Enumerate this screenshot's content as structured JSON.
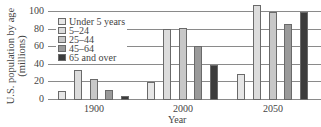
{
  "chart_data": {
    "type": "bar",
    "title": "",
    "xlabel": "Year",
    "ylabel": "U.S. population by age (millions)",
    "ylabel_lines": [
      "U.S. population by age",
      "(millions)"
    ],
    "ylim": [
      0,
      100
    ],
    "yticks": [
      "0",
      "20",
      "40",
      "60",
      "80",
      "100"
    ],
    "grid": true,
    "legend_position": "upper-left",
    "categories": [
      "1900",
      "2000",
      "2050"
    ],
    "series": [
      {
        "name": "Under 5 years",
        "color": "#e6e6e6",
        "values": [
          9,
          19,
          28
        ]
      },
      {
        "name": "5–24",
        "color": "#dcdcdc",
        "values": [
          33,
          79,
          107
        ]
      },
      {
        "name": "25–44",
        "color": "#c8c8c8",
        "values": [
          23,
          81,
          99
        ]
      },
      {
        "name": "45–64",
        "color": "#9a9a9a",
        "values": [
          10,
          60,
          85
        ]
      },
      {
        "name": "65 and over",
        "color": "#3c3c3c",
        "values": [
          3,
          39,
          99
        ]
      }
    ]
  }
}
